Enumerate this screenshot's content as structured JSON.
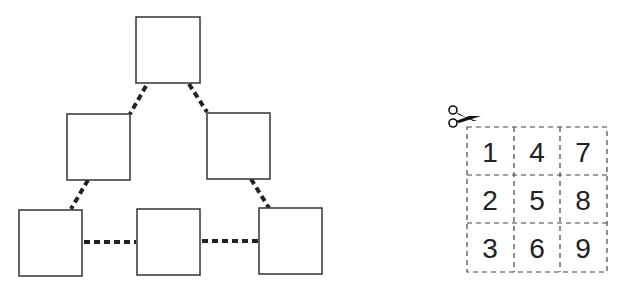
{
  "puzzle": {
    "boxes": [
      {
        "id": "top",
        "x": 136,
        "y": 17,
        "w": 64,
        "h": 66
      },
      {
        "id": "mid-left",
        "x": 67,
        "y": 114,
        "w": 63,
        "h": 66
      },
      {
        "id": "mid-right",
        "x": 207,
        "y": 113,
        "w": 63,
        "h": 66
      },
      {
        "id": "bottom-left",
        "x": 19,
        "y": 210,
        "w": 63,
        "h": 66
      },
      {
        "id": "bottom-mid",
        "x": 137,
        "y": 209,
        "w": 63,
        "h": 66
      },
      {
        "id": "bottom-right",
        "x": 259,
        "y": 208,
        "w": 63,
        "h": 66
      }
    ],
    "connectors": [
      {
        "from": "top",
        "to": "mid-left"
      },
      {
        "from": "top",
        "to": "mid-right"
      },
      {
        "from": "mid-left",
        "to": "bottom-left"
      },
      {
        "from": "mid-right",
        "to": "bottom-right"
      },
      {
        "from": "bottom-left",
        "to": "bottom-mid"
      },
      {
        "from": "bottom-mid",
        "to": "bottom-right"
      }
    ]
  },
  "cutout_grid": {
    "icon": "scissors-icon",
    "cells": [
      [
        "1",
        "4",
        "7"
      ],
      [
        "2",
        "5",
        "8"
      ],
      [
        "3",
        "6",
        "9"
      ]
    ]
  }
}
